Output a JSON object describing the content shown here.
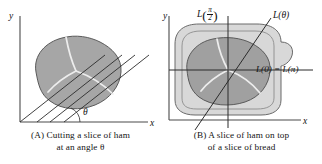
{
  "figure": {
    "background": "#ffffff",
    "ham_fill": "#a6a6a6",
    "ham_stroke": "#555555",
    "bread_fill": "#d8d8d8",
    "bread_stroke": "#6a6a6a",
    "line_color": "#2b2b2b",
    "axis_color": "#4a4a4a",
    "marble_color": "#ededed"
  },
  "panel_a": {
    "caption_line1": "(A) Cutting a slice of ham",
    "caption_line2": "at an angle θ",
    "axis_x_label": "x",
    "axis_y_label": "y",
    "angle_label": "θ",
    "num_cut_lines": 4,
    "cut_line_slope_deg": 38
  },
  "panel_b": {
    "caption_line1": "(B) A slice of ham on top",
    "caption_line2": "of a slice of bread",
    "axis_x_label": "x",
    "axis_y_label": "y",
    "label_vertical_L": "L",
    "label_vertical_arg_num": "π",
    "label_vertical_arg_den": "2",
    "label_diagonal": "L(θ)",
    "label_horizontal": "L(0) = L(π)"
  }
}
